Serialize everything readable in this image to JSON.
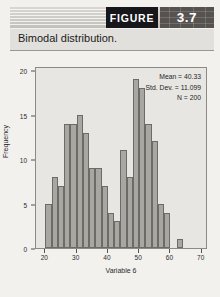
{
  "header": {
    "figure_label": "FIGURE",
    "figure_number": "3.7"
  },
  "caption": "Bimodal distribution.",
  "chart_data": {
    "type": "bar",
    "title": "",
    "subtitle": "",
    "xlabel": "Variable 6",
    "ylabel": "Frequency",
    "xlim": [
      17,
      72
    ],
    "ylim": [
      0,
      20.5
    ],
    "xticks": [
      20,
      30,
      40,
      50,
      60,
      70
    ],
    "yticks": [
      0,
      5,
      10,
      15,
      20
    ],
    "grid": false,
    "legend": null,
    "bin_width": 2,
    "bin_starts": [
      20,
      22,
      24,
      26,
      28,
      30,
      32,
      34,
      36,
      38,
      40,
      42,
      44,
      46,
      48,
      50,
      52,
      54,
      56,
      58,
      62
    ],
    "categories": [
      "20-22",
      "22-24",
      "24-26",
      "26-28",
      "28-30",
      "30-32",
      "32-34",
      "34-36",
      "36-38",
      "38-40",
      "40-42",
      "42-44",
      "44-46",
      "46-48",
      "48-50",
      "50-52",
      "52-54",
      "54-56",
      "56-58",
      "58-60",
      "62-64"
    ],
    "values": [
      5,
      8,
      7,
      14,
      14,
      15,
      13,
      9,
      9,
      7,
      4,
      3,
      11,
      8,
      19,
      18,
      14,
      12,
      5,
      4,
      1
    ],
    "annotations": [
      "Mean = 40.33",
      "Std. Dev. = 11.099",
      "N = 200"
    ],
    "bar_fill": "#a9a7a2",
    "bar_edge": "#6d6b66",
    "plot_background": "#e7e6e2"
  },
  "stats": {
    "mean": "Mean = 40.33",
    "std_dev": "Std. Dev. = 11.099",
    "n": "N = 200"
  }
}
